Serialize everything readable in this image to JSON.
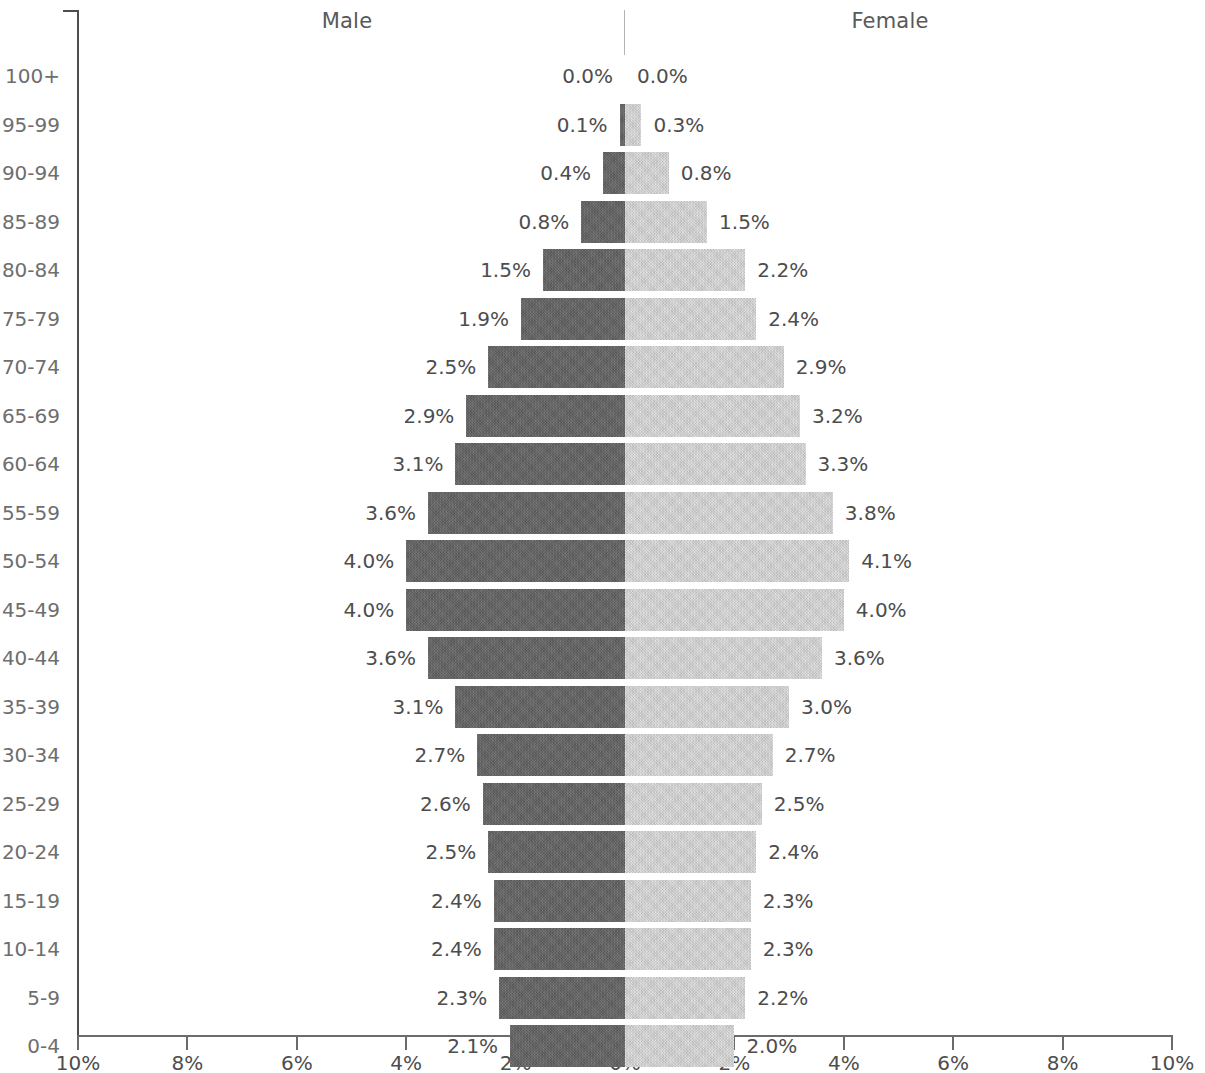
{
  "header": {
    "male_label": "Male",
    "female_label": "Female"
  },
  "axis": {
    "x_tick_labels": [
      "10%",
      "8%",
      "6%",
      "4%",
      "2%",
      "0%",
      "2%",
      "4%",
      "6%",
      "8%",
      "10%"
    ],
    "x_tick_values": [
      -10,
      -8,
      -6,
      -4,
      -2,
      0,
      2,
      4,
      6,
      8,
      10
    ]
  },
  "colors": {
    "male_bar": "#636363",
    "female_bar": "#d9d9d9",
    "axis": "#6b6b6b",
    "label_text": "#4d4d4d",
    "category_text": "#6e6e6e"
  },
  "chart_data": {
    "type": "bar",
    "subtype": "population-pyramid",
    "title": "",
    "xlabel": "",
    "ylabel": "",
    "xlim": [
      -10,
      10
    ],
    "grid": false,
    "legend_position": "top",
    "categories": [
      "100+",
      "95-99",
      "90-94",
      "85-89",
      "80-84",
      "75-79",
      "70-74",
      "65-69",
      "60-64",
      "55-59",
      "50-54",
      "45-49",
      "40-44",
      "35-39",
      "30-34",
      "25-29",
      "20-24",
      "15-19",
      "10-14",
      "5-9",
      "0-4"
    ],
    "series": [
      {
        "name": "Male",
        "values": [
          0.0,
          0.1,
          0.4,
          0.8,
          1.5,
          1.9,
          2.5,
          2.9,
          3.1,
          3.6,
          4.0,
          4.0,
          3.6,
          3.1,
          2.7,
          2.6,
          2.5,
          2.4,
          2.4,
          2.3,
          2.1
        ],
        "labels": [
          "0.0%",
          "0.1%",
          "0.4%",
          "0.8%",
          "1.5%",
          "1.9%",
          "2.5%",
          "2.9%",
          "3.1%",
          "3.6%",
          "4.0%",
          "4.0%",
          "3.6%",
          "3.1%",
          "2.7%",
          "2.6%",
          "2.5%",
          "2.4%",
          "2.4%",
          "2.3%",
          "2.1%"
        ]
      },
      {
        "name": "Female",
        "values": [
          0.0,
          0.3,
          0.8,
          1.5,
          2.2,
          2.4,
          2.9,
          3.2,
          3.3,
          3.8,
          4.1,
          4.0,
          3.6,
          3.0,
          2.7,
          2.5,
          2.4,
          2.3,
          2.3,
          2.2,
          2.0
        ],
        "labels": [
          "0.0%",
          "0.3%",
          "0.8%",
          "1.5%",
          "2.2%",
          "2.4%",
          "2.9%",
          "3.2%",
          "3.3%",
          "3.8%",
          "4.1%",
          "4.0%",
          "3.6%",
          "3.0%",
          "2.7%",
          "2.5%",
          "2.4%",
          "2.3%",
          "2.3%",
          "2.2%",
          "2.0%"
        ]
      }
    ]
  }
}
